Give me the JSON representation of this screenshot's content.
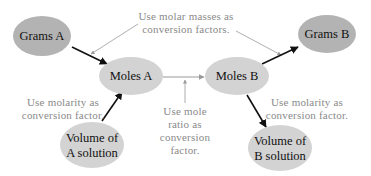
{
  "diagram": {
    "colors": {
      "node_dark": "#b3b3b3",
      "node_light": "#d3d3d3",
      "note_text": "#8a8a8a",
      "arrow_dark": "#111111",
      "arrow_light": "#9a9a9a"
    },
    "nodes": {
      "grams_a": {
        "label": "Grams A"
      },
      "moles_a": {
        "label": "Moles A"
      },
      "moles_b": {
        "label": "Moles B"
      },
      "grams_b": {
        "label": "Grams B"
      },
      "volume_a": {
        "line1": "Volume of",
        "line2": "A solution"
      },
      "volume_b": {
        "line1": "Volume of",
        "line2": "B solution"
      }
    },
    "notes": {
      "molar_masses": {
        "line1": "Use molar masses as",
        "line2": "conversion factors."
      },
      "molarity_a": {
        "line1": "Use molarity as",
        "line2": "conversion factor."
      },
      "molarity_b": {
        "line1": "Use molarity as",
        "line2": "conversion factor."
      },
      "mole_ratio": {
        "line1": "Use mole",
        "line2": "ratio as",
        "line3": "conversion",
        "line4": "factor."
      }
    },
    "edges": [
      {
        "from": "Grams A",
        "to": "Moles A"
      },
      {
        "from": "Volume of A solution",
        "to": "Moles A"
      },
      {
        "from": "Moles A",
        "to": "Moles B"
      },
      {
        "from": "Moles B",
        "to": "Grams B"
      },
      {
        "from": "Moles B",
        "to": "Volume of B solution"
      }
    ]
  }
}
